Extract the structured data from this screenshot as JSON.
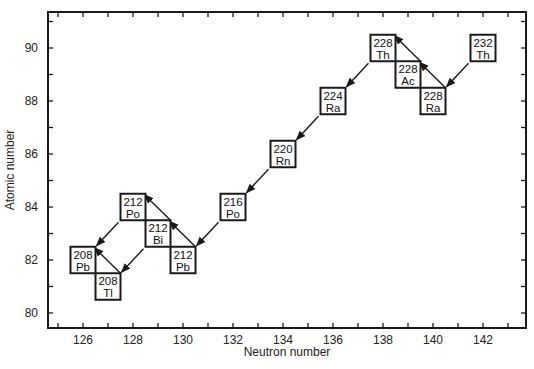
{
  "chart_data": {
    "type": "diagram-scatter",
    "title": "",
    "xlabel": "Neutron number",
    "ylabel": "Atomic number",
    "xlim": [
      124.5,
      143.5
    ],
    "ylim": [
      79.5,
      91.5
    ],
    "xticks": [
      126,
      128,
      130,
      132,
      134,
      136,
      138,
      140,
      142
    ],
    "yticks": [
      80,
      82,
      84,
      86,
      88,
      90
    ],
    "x_minor_step": 1,
    "y_minor_step": 1,
    "grid": false,
    "nuclides": [
      {
        "id": "th232",
        "mass": "232",
        "symbol": "Th",
        "N": 142,
        "Z": 90
      },
      {
        "id": "ra228",
        "mass": "228",
        "symbol": "Ra",
        "N": 140,
        "Z": 88
      },
      {
        "id": "ac228",
        "mass": "228",
        "symbol": "Ac",
        "N": 139,
        "Z": 89
      },
      {
        "id": "th228",
        "mass": "228",
        "symbol": "Th",
        "N": 138,
        "Z": 90
      },
      {
        "id": "ra224",
        "mass": "224",
        "symbol": "Ra",
        "N": 136,
        "Z": 88
      },
      {
        "id": "rn220",
        "mass": "220",
        "symbol": "Rn",
        "N": 134,
        "Z": 86
      },
      {
        "id": "po216",
        "mass": "216",
        "symbol": "Po",
        "N": 132,
        "Z": 84
      },
      {
        "id": "pb212",
        "mass": "212",
        "symbol": "Pb",
        "N": 130,
        "Z": 82
      },
      {
        "id": "bi212",
        "mass": "212",
        "symbol": "Bi",
        "N": 129,
        "Z": 83
      },
      {
        "id": "po212",
        "mass": "212",
        "symbol": "Po",
        "N": 128,
        "Z": 84
      },
      {
        "id": "tl208",
        "mass": "208",
        "symbol": "Tl",
        "N": 127,
        "Z": 81
      },
      {
        "id": "pb208",
        "mass": "208",
        "symbol": "Pb",
        "N": 126,
        "Z": 82
      }
    ],
    "decays": [
      {
        "from": "th232",
        "to": "ra228",
        "mode": "alpha"
      },
      {
        "from": "ra228",
        "to": "ac228",
        "mode": "beta"
      },
      {
        "from": "ac228",
        "to": "th228",
        "mode": "beta"
      },
      {
        "from": "th228",
        "to": "ra224",
        "mode": "alpha"
      },
      {
        "from": "ra224",
        "to": "rn220",
        "mode": "alpha"
      },
      {
        "from": "rn220",
        "to": "po216",
        "mode": "alpha"
      },
      {
        "from": "po216",
        "to": "pb212",
        "mode": "alpha"
      },
      {
        "from": "pb212",
        "to": "bi212",
        "mode": "beta"
      },
      {
        "from": "bi212",
        "to": "po212",
        "mode": "beta"
      },
      {
        "from": "bi212",
        "to": "tl208",
        "mode": "alpha"
      },
      {
        "from": "po212",
        "to": "pb208",
        "mode": "alpha"
      },
      {
        "from": "tl208",
        "to": "pb208",
        "mode": "beta"
      }
    ]
  },
  "style": {
    "ink": "#1a1a1a",
    "background": "#ffffff"
  }
}
